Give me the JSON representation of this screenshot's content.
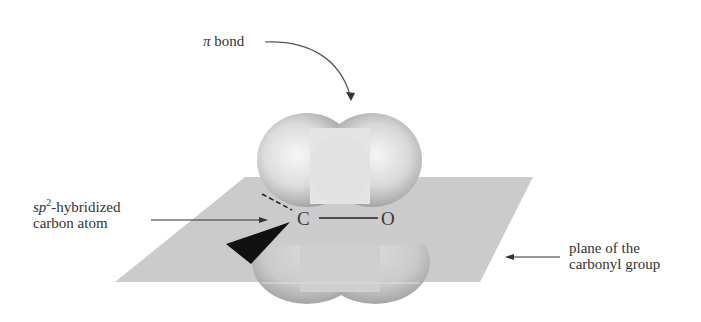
{
  "figure": {
    "labels": {
      "pi_bond": {
        "symbol": "π",
        "text": " bond"
      },
      "carbon": {
        "line1_italic": "sp",
        "line1_sup": "2",
        "line1_rest": "-hybridized",
        "line2": "carbon atom"
      },
      "plane": {
        "line1": "plane of the",
        "line2": "carbonyl group"
      }
    },
    "atoms": {
      "carbon": "C",
      "oxygen": "O"
    },
    "colors": {
      "plane": "#c8c8c8",
      "orbital": "#bdbdbd",
      "wedge": "#111111",
      "text": "#333333"
    }
  }
}
